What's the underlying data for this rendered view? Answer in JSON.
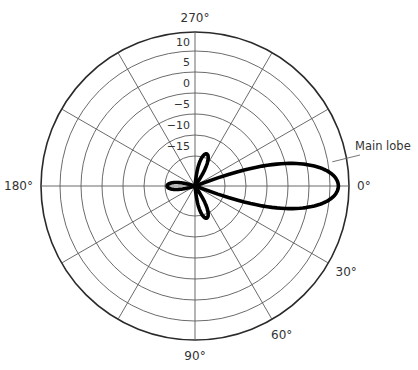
{
  "chart_data": {
    "type": "polar",
    "title": "",
    "radial_unit": "dB",
    "radial_ticks": [
      10,
      5,
      0,
      -5,
      -10,
      -15
    ],
    "radial_tick_labels": [
      "10",
      "5",
      "0",
      "−10",
      "−15"
    ],
    "radial_tick_text": [
      "10",
      "5",
      "0",
      "−5",
      "−10",
      "−15"
    ],
    "radial_range": [
      -22,
      14.5
    ],
    "angle_direction": "clockwise",
    "angle_zero": "right",
    "angular_grid_step_deg": 30,
    "angle_labels": [
      {
        "angle": 0,
        "text": "0°"
      },
      {
        "angle": 30,
        "text": "30°"
      },
      {
        "angle": 60,
        "text": "60°"
      },
      {
        "angle": 90,
        "text": "90°"
      },
      {
        "angle": 180,
        "text": "180°"
      },
      {
        "angle": 270,
        "text": "270°"
      }
    ],
    "series": [
      {
        "name": "Radiation pattern",
        "lobes": [
          {
            "name": "Main lobe",
            "direction_deg": 0,
            "peak_db": 12,
            "half_width_deg": 20
          },
          {
            "name": "Side lobe",
            "direction_deg": 70,
            "peak_db": -14,
            "half_width_deg": 14
          },
          {
            "name": "Side lobe",
            "direction_deg": 290,
            "peak_db": -14,
            "half_width_deg": 14
          },
          {
            "name": "Back lobe",
            "direction_deg": 180,
            "peak_db": -15.5,
            "half_width_deg": 16
          }
        ]
      }
    ],
    "annotations": [
      {
        "text": "Main lobe",
        "points_to_angle_deg": 350
      }
    ],
    "grid": true,
    "legend": "none"
  }
}
